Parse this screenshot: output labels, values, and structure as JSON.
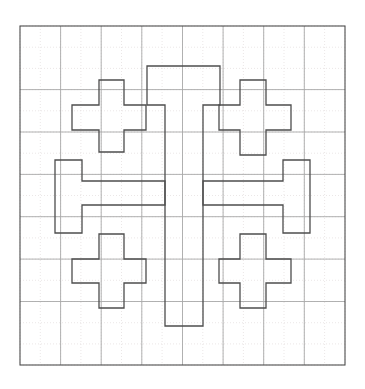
{
  "canvas": {
    "width": 365,
    "height": 389,
    "background_color": "#ffffff",
    "title": ""
  },
  "figure": {
    "name": "jerusalem-cross-on-grid",
    "frame": {
      "x": 20,
      "y": 26,
      "width": 325,
      "height": 339,
      "stroke_color": "#4d4d4d",
      "stroke_width": 1.1,
      "fill": "none"
    },
    "grid": {
      "visible": true,
      "minor": {
        "stroke_color": "#e2dcdc",
        "stroke_width": 0.7,
        "dash": "1,2",
        "x_lines": [
          20,
          40.3,
          60.6,
          80.9,
          101.2,
          121.5,
          141.8,
          162.1,
          182.5,
          202.8,
          223.1,
          243.4,
          263.7,
          284.0,
          304.3,
          324.6,
          345
        ],
        "y_lines": [
          26,
          47.2,
          68.4,
          89.6,
          110.8,
          132.0,
          153.2,
          174.4,
          195.5,
          216.7,
          237.9,
          259.1,
          280.3,
          301.5,
          322.7,
          343.9,
          365
        ]
      },
      "major": {
        "stroke_color": "#a8a8a8",
        "stroke_width": 0.9,
        "x_lines": [
          60.6,
          101.2,
          141.8,
          182.5,
          223.1,
          263.7,
          304.3
        ],
        "y_lines": [
          89.6,
          132.0,
          174.4,
          216.7,
          259.1,
          301.5
        ]
      }
    },
    "shapes": {
      "stroke_color": "#4d4d4d",
      "stroke_width": 1.3,
      "fill": "none",
      "items": [
        {
          "name": "central-cross",
          "type": "polygon",
          "points": "147,66 220,66 220,105 203,105 203,326 165,326 165,105 147,105"
        },
        {
          "name": "upper-left-crosslet",
          "type": "polygon",
          "points": "99,80 124,80 124,105 146,105 146,130 124,130 124,152 99,152 99,130 72,130 72,105 99,105"
        },
        {
          "name": "upper-right-crosslet",
          "type": "polygon",
          "points": "240,80 266,80 266,105 291,105 291,130 266,130 266,155 240,155 240,130 219,130 219,105 240,105"
        },
        {
          "name": "lower-left-crosslet",
          "type": "polygon",
          "points": "99,234 124,234 124,259 146,259 146,283 124,283 124,308 99,308 99,283 72,283 72,259 99,259"
        },
        {
          "name": "lower-right-crosslet",
          "type": "polygon",
          "points": "240,234 266,234 266,259 291,259 291,283 266,283 266,308 240,308 240,283 219,283 219,259 240,259"
        },
        {
          "name": "left-arm-bar",
          "type": "polygon",
          "points": "55,160 82,160 82,181 165,181 165,205 82,205 82,233 55,233"
        },
        {
          "name": "right-arm-bar",
          "type": "polygon",
          "points": "310,160 283,160 283,181 203,181 203,205 283,205 283,233 310,233"
        }
      ]
    }
  }
}
